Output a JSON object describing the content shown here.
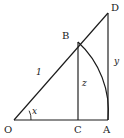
{
  "figure": {
    "type": "geometry-diagram",
    "background_color": "#ffffff",
    "stroke_color": "#1a1a1a",
    "width": 124,
    "height": 138,
    "points": {
      "O": {
        "label": "O",
        "x": 14,
        "y": 120
      },
      "A": {
        "label": "A",
        "x": 108,
        "y": 120
      },
      "D": {
        "label": "D",
        "x": 108,
        "y": 13
      },
      "B": {
        "label": "B",
        "x": 78,
        "y": 42
      },
      "C": {
        "label": "C",
        "x": 78,
        "y": 120
      }
    },
    "point_labels": {
      "O": {
        "text": "O",
        "x": 4,
        "y": 133
      },
      "A": {
        "text": "A",
        "x": 103,
        "y": 133
      },
      "D": {
        "text": "D",
        "x": 111,
        "y": 11
      },
      "B": {
        "text": "B",
        "x": 62,
        "y": 39
      },
      "C": {
        "text": "C",
        "x": 74,
        "y": 133
      }
    },
    "segments": [
      {
        "name": "baseline-OA",
        "from": "O",
        "to": "A"
      },
      {
        "name": "hypotenuse-OD",
        "from": "O",
        "to": "D"
      },
      {
        "name": "vertical-AD",
        "from": "A",
        "to": "D"
      },
      {
        "name": "vertical-BC",
        "from": "B",
        "to": "C"
      }
    ],
    "arc": {
      "name": "arc-BA",
      "center": "O",
      "from": "B",
      "to": "A",
      "radius": 94
    },
    "angle": {
      "name": "angle-at-O",
      "vertex": "O",
      "label": "x",
      "label_x": 32,
      "label_y": 114,
      "arc_radius": 17
    },
    "length_labels": [
      {
        "name": "label-OB",
        "text": "1",
        "x": 36,
        "y": 75
      },
      {
        "name": "label-BC",
        "text": "z",
        "x": 82,
        "y": 86
      },
      {
        "name": "label-AD",
        "text": "y",
        "x": 114,
        "y": 64
      }
    ]
  }
}
